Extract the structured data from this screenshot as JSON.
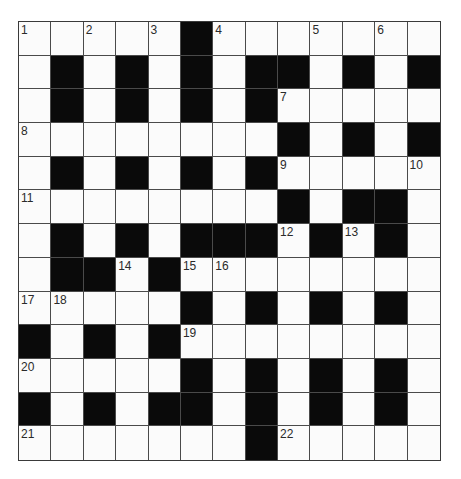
{
  "puzzle": {
    "rows": 13,
    "cols": 13,
    "layout": [
      "WWWWWBWWWWWWW",
      "WBWBWBWBBWBWB",
      "WBWBWBWBWWWWW",
      "WWWWWWWWBWBWB",
      "WBWBWBWBWWWWW",
      "WWWWWWWWBWBBW",
      "WBWBWBBBWBWBW",
      "WBBWBWWWWWWWW",
      "WWWWWBWBWBWBW",
      "BWBWBWWWWWWWW",
      "WWWWWBWBWBWBW",
      "BWBWBBWBWBWBW",
      "WWWWWWWBWWWWW"
    ],
    "numbers": [
      {
        "row": 0,
        "col": 0,
        "n": "1"
      },
      {
        "row": 0,
        "col": 2,
        "n": "2"
      },
      {
        "row": 0,
        "col": 4,
        "n": "3"
      },
      {
        "row": 0,
        "col": 6,
        "n": "4"
      },
      {
        "row": 0,
        "col": 9,
        "n": "5"
      },
      {
        "row": 0,
        "col": 11,
        "n": "6"
      },
      {
        "row": 2,
        "col": 8,
        "n": "7"
      },
      {
        "row": 3,
        "col": 0,
        "n": "8"
      },
      {
        "row": 4,
        "col": 8,
        "n": "9"
      },
      {
        "row": 4,
        "col": 12,
        "n": "10"
      },
      {
        "row": 5,
        "col": 0,
        "n": "11"
      },
      {
        "row": 6,
        "col": 8,
        "n": "12"
      },
      {
        "row": 6,
        "col": 10,
        "n": "13"
      },
      {
        "row": 7,
        "col": 3,
        "n": "14"
      },
      {
        "row": 7,
        "col": 5,
        "n": "15"
      },
      {
        "row": 7,
        "col": 6,
        "n": "16"
      },
      {
        "row": 8,
        "col": 0,
        "n": "17"
      },
      {
        "row": 8,
        "col": 1,
        "n": "18"
      },
      {
        "row": 9,
        "col": 5,
        "n": "19"
      },
      {
        "row": 10,
        "col": 0,
        "n": "20"
      },
      {
        "row": 12,
        "col": 0,
        "n": "21"
      },
      {
        "row": 12,
        "col": 8,
        "n": "22"
      }
    ]
  },
  "colors": {
    "black_square": "#0a0a0a",
    "white_square": "#fbfbfb",
    "grid_line": "#4a4a4a"
  }
}
